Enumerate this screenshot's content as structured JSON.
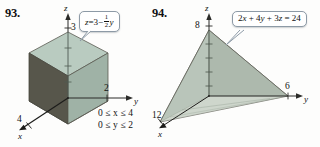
{
  "page": {
    "background": "#fdfdfc",
    "width": 320,
    "height": 147
  },
  "figures": [
    {
      "number": "93.",
      "shape": "rectangular-solid",
      "equation": {
        "full": "z = 3 - (1/2)y",
        "lhs": "z",
        "eq": "=",
        "rhs_int": "3",
        "minus": "−",
        "frac_num": "1",
        "frac_den": "2",
        "frac_var": "y"
      },
      "axes": {
        "x": "x",
        "y": "y",
        "z": "z"
      },
      "ticks": {
        "z": "3",
        "y": "2",
        "x": "4"
      },
      "constraints": [
        "0 ≤ x ≤ 4",
        "0 ≤ y ≤ 2"
      ],
      "colors": {
        "top_face": "#b9cbc0",
        "left_face": "#57564b",
        "right_face": "#9fb2a6",
        "edge": "#4a4a44"
      }
    },
    {
      "number": "94.",
      "shape": "tetrahedron",
      "equation": {
        "full": "2x + 4y + 3z = 24",
        "t1_coef": "2",
        "t1_var": "x",
        "plus1": "+",
        "t2_coef": "4",
        "t2_var": "y",
        "plus2": "+",
        "t3_coef": "3",
        "t3_var": "z",
        "eq": "=",
        "rhs": "24"
      },
      "axes": {
        "x": "x",
        "y": "y",
        "z": "z"
      },
      "ticks": {
        "z": "8",
        "y": "6",
        "x": "12"
      },
      "colors": {
        "left_face": "#c2cfc5",
        "right_face": "#93a094",
        "bottom_face": "#d4dcd2",
        "edge": "#5a5a52"
      }
    }
  ]
}
